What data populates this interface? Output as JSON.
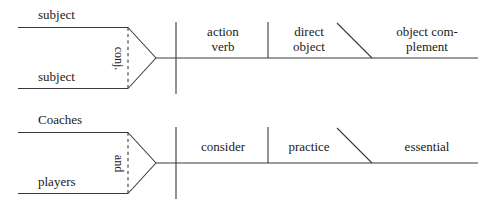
{
  "figure": {
    "type": "sentence-diagram",
    "kind": "Reed-Kellogg diagram",
    "line_color": "#3a3a3a",
    "text_color": "#1a1a1a",
    "background": "#ffffff"
  },
  "diagrams": [
    {
      "id": "template",
      "name": "pattern-diagram",
      "subject_upper": "subject",
      "subject_lower": "subject",
      "conjunction": "conj.",
      "verb_line_1": "action",
      "verb_line_2": "verb",
      "object_line_1": "direct",
      "object_line_2": "object",
      "complement_line_1": "object com-",
      "complement_line_2": "plement"
    },
    {
      "id": "example",
      "name": "example-diagram",
      "subject_upper": "Coaches",
      "subject_lower": "players",
      "conjunction": "and",
      "verb_line_1": "consider",
      "verb_line_2": "",
      "object_line_1": "practice",
      "object_line_2": "",
      "complement_line_1": "essential",
      "complement_line_2": ""
    }
  ]
}
